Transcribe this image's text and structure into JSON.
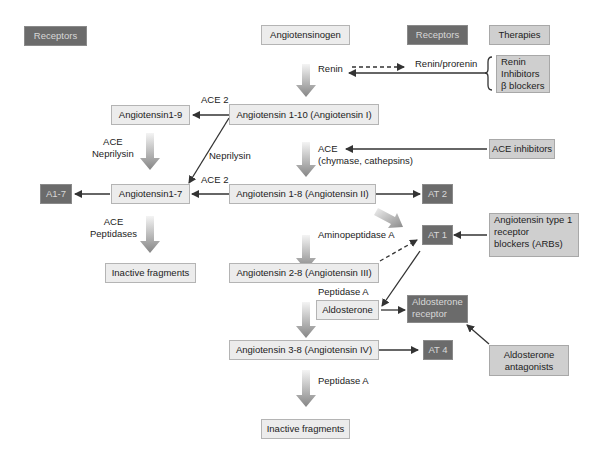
{
  "legend": {
    "receptors_left": "Receptors",
    "receptors_right": "Receptors",
    "therapies": "Therapies"
  },
  "nodes": {
    "angiotensinogen": "Angiotensinogen",
    "ang_1_10": "Angiotensin 1-10 (Angiotensin I)",
    "ang_1_9": "Angiotensin1-9",
    "ang_1_8": "Angiotensin 1-8 (Angiotensin II)",
    "ang_1_7": "Angiotensin1-7",
    "ang_2_8": "Angiotensin 2-8 (Angiotensin III)",
    "ang_3_8": "Angiotensin 3-8 (Angiotensin IV)",
    "aldosterone": "Aldosterone",
    "inactive_left": "Inactive fragments",
    "inactive_bottom": "Inactive fragments"
  },
  "receptors": {
    "a1_7": "A1-7",
    "at2": "AT 2",
    "at1": "AT 1",
    "at4": "AT 4",
    "aldosterone_receptor_line1": "Aldosterone",
    "aldosterone_receptor_line2": "receptor"
  },
  "therapies": {
    "renin_inhibitors_line1": "Renin",
    "renin_inhibitors_line2": "Inhibitors",
    "renin_inhibitors_line3": "β blockers",
    "ace_inhibitors": "ACE inhibitors",
    "arbs_line1": "Angiotensin type 1",
    "arbs_line2": "receptor",
    "arbs_line3": "blockers (ARBs)",
    "aldo_antag_line1": "Aldosterone",
    "aldo_antag_line2": "antagonists"
  },
  "enzymes": {
    "renin": "Renin",
    "renin_prorenin": "Renin/prorenin",
    "ace2_top": "ACE 2",
    "ace2_mid": "ACE 2",
    "ace_neprilysin_line1": "ACE",
    "ace_neprilysin_line2": "Neprilysin",
    "neprilysin": "Neprilysin",
    "ace_main_line1": "ACE",
    "ace_main_line2": "(chymase, cathepsins)",
    "ace_peptidases_line1": "ACE",
    "ace_peptidases_line2": "Peptidases",
    "aminopeptidase_a": "Aminopeptidase A",
    "peptidase_a_upper": "Peptidase A",
    "peptidase_a_lower": "Peptidase A"
  },
  "colors": {
    "receptor_box": "#6b6b6b",
    "therapy_box": "#cfcfcf",
    "node_box": "#ececec",
    "arrow": "#333333",
    "pathway_arrow": "#8c8c8c"
  }
}
